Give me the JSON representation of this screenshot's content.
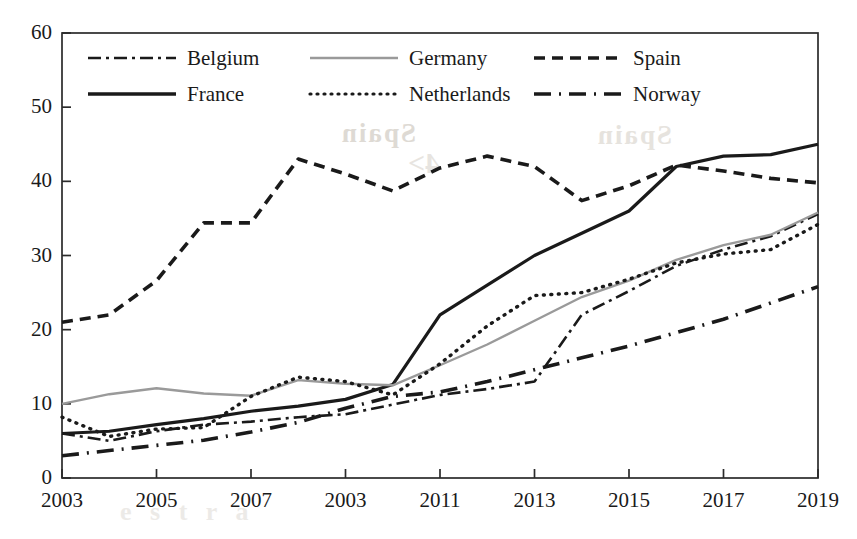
{
  "chart_data": {
    "type": "line",
    "title": "",
    "subtitle": "",
    "xlabel": "",
    "ylabel": "",
    "xlim": [
      2003,
      2019
    ],
    "ylim": [
      0,
      60
    ],
    "yticks": [
      0,
      10,
      20,
      30,
      40,
      50,
      60
    ],
    "xticks": [
      2003,
      2005,
      2007,
      2009,
      2011,
      2013,
      2015,
      2017,
      2019
    ],
    "xtick_labels": [
      "2003",
      "2005",
      "2007",
      "2003",
      "2011",
      "2013",
      "2015",
      "2017",
      "2019"
    ],
    "grid": false,
    "legend_position": "top-left inside",
    "legend_columns": 3,
    "x": [
      2003,
      2004,
      2005,
      2006,
      2007,
      2008,
      2009,
      2010,
      2011,
      2012,
      2013,
      2014,
      2015,
      2016,
      2017,
      2018,
      2019
    ],
    "series": [
      {
        "name": "Belgium",
        "style": "dashdot",
        "color": "#1a1a1a",
        "width": 2.6,
        "values": [
          6.0,
          5.0,
          6.3,
          7.2,
          7.6,
          8.2,
          8.6,
          9.9,
          11.2,
          12.0,
          13.0,
          22.0,
          25.2,
          28.6,
          30.8,
          32.6,
          35.6
        ]
      },
      {
        "name": "France",
        "style": "solid",
        "color": "#1a1a1a",
        "width": 3.2,
        "values": [
          6.0,
          6.3,
          7.2,
          8.0,
          9.0,
          9.7,
          10.6,
          12.6,
          22.0,
          26.0,
          30.0,
          33.0,
          36.0,
          42.0,
          43.4,
          43.6,
          45.0
        ]
      },
      {
        "name": "Germany",
        "style": "solid",
        "color": "#9a9a9a",
        "width": 2.4,
        "values": [
          10.0,
          11.3,
          12.1,
          11.4,
          11.1,
          13.2,
          12.7,
          12.5,
          15.2,
          18.0,
          21.2,
          24.4,
          26.6,
          29.4,
          31.4,
          32.8,
          35.8
        ]
      },
      {
        "name": "Netherlands",
        "style": "dotted",
        "color": "#1a1a1a",
        "width": 3.4,
        "values": [
          8.2,
          5.6,
          6.6,
          6.8,
          11.0,
          13.6,
          13.0,
          11.2,
          15.4,
          20.5,
          24.6,
          25.0,
          26.8,
          29.0,
          30.2,
          30.8,
          34.2
        ]
      },
      {
        "name": "Spain",
        "style": "dashed",
        "color": "#1a1a1a",
        "width": 3.6,
        "values": [
          21.0,
          22.0,
          26.6,
          34.4,
          34.4,
          43.0,
          41.0,
          38.7,
          41.8,
          43.4,
          42.0,
          37.4,
          39.4,
          42.2,
          41.4,
          40.4,
          39.8
        ]
      },
      {
        "name": "Norway",
        "style": "longdash",
        "color": "#1a1a1a",
        "width": 3.6,
        "values": [
          3.0,
          3.7,
          4.4,
          5.1,
          6.2,
          7.5,
          9.4,
          11.0,
          11.6,
          13.0,
          14.6,
          16.2,
          17.8,
          19.6,
          21.4,
          23.6,
          25.8
        ]
      }
    ]
  },
  "legend": {
    "entries": [
      {
        "label": "Belgium",
        "sample": "dashdot-line-icon"
      },
      {
        "label": "Germany",
        "sample": "solid-gray-line-icon"
      },
      {
        "label": "Spain",
        "sample": "dashed-line-icon"
      },
      {
        "label": "France",
        "sample": "solid-black-line-icon"
      },
      {
        "label": "Netherlands",
        "sample": "dotted-line-icon"
      },
      {
        "label": "Norway",
        "sample": "longdash-line-icon"
      }
    ]
  },
  "artifacts": {
    "ghost_a": "Spain",
    "ghost_b": "Spain",
    "ghost_c": "4>",
    "ghost_d": "e  s  t  r  a"
  }
}
